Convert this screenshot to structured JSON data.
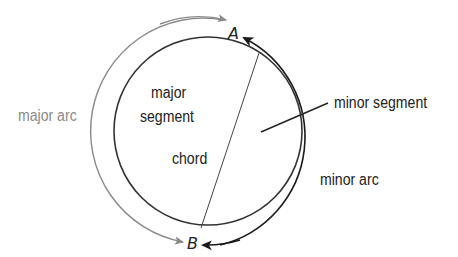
{
  "diagram": {
    "points": {
      "A": "A",
      "B": "B"
    },
    "labels": {
      "major_arc": "major arc",
      "minor_arc": "minor arc",
      "major_segment_line1": "major",
      "major_segment_line2": "segment",
      "minor_segment": "minor segment",
      "chord": "chord"
    },
    "colors": {
      "major_arc": "#8a8a8a",
      "minor_arc": "#1a1a1a",
      "circle": "#333333",
      "chord": "#444444",
      "text": "#222222",
      "major_arc_text": "#8a8a8a"
    },
    "geometry": {
      "circle_center": [
        208,
        131
      ],
      "circle_radius": 94,
      "outer_arc_radius": 111,
      "chord_endpoints": [
        [
          259,
          53
        ],
        [
          201,
          228
        ]
      ]
    }
  }
}
